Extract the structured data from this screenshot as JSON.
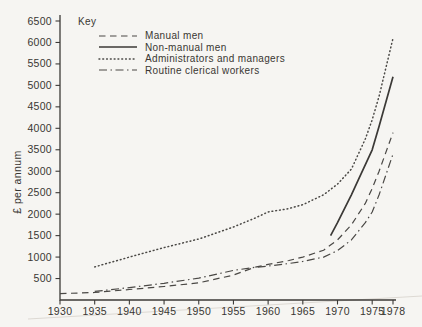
{
  "page": {
    "paper_color": "#f6f5f2",
    "ink_color": "#4a4845"
  },
  "chart_data": {
    "type": "line",
    "title": "",
    "xlabel": "",
    "ylabel": "£ per annum",
    "xlim": [
      1930,
      1978
    ],
    "ylim": [
      0,
      6500
    ],
    "x_ticks": [
      1930,
      1935,
      1940,
      1945,
      1950,
      1955,
      1960,
      1965,
      1970,
      1975,
      1978
    ],
    "y_ticks": [
      500,
      1000,
      1500,
      2000,
      2500,
      3000,
      3500,
      4000,
      4500,
      5000,
      5500,
      6000,
      6500
    ],
    "grid": false,
    "legend": {
      "title": "Key",
      "position": "top-left"
    },
    "series": [
      {
        "name": "Manual men",
        "style": "dashed",
        "points": [
          [
            1930,
            150
          ],
          [
            1935,
            175
          ],
          [
            1940,
            245
          ],
          [
            1945,
            315
          ],
          [
            1950,
            400
          ],
          [
            1955,
            580
          ],
          [
            1958,
            760
          ],
          [
            1960,
            830
          ],
          [
            1963,
            920
          ],
          [
            1965,
            1000
          ],
          [
            1968,
            1160
          ],
          [
            1970,
            1400
          ],
          [
            1972,
            1750
          ],
          [
            1974,
            2250
          ],
          [
            1975,
            2600
          ],
          [
            1976,
            3000
          ],
          [
            1978,
            3900
          ]
        ]
      },
      {
        "name": "Non-manual men",
        "style": "solid",
        "points": [
          [
            1969,
            1500
          ],
          [
            1970,
            1800
          ],
          [
            1972,
            2450
          ],
          [
            1973,
            2800
          ],
          [
            1975,
            3500
          ],
          [
            1976,
            4050
          ],
          [
            1978,
            5200
          ]
        ]
      },
      {
        "name": "Administrators and managers",
        "style": "dotted",
        "points": [
          [
            1935,
            770
          ],
          [
            1940,
            1000
          ],
          [
            1945,
            1220
          ],
          [
            1950,
            1420
          ],
          [
            1955,
            1700
          ],
          [
            1958,
            1900
          ],
          [
            1960,
            2050
          ],
          [
            1963,
            2130
          ],
          [
            1965,
            2220
          ],
          [
            1968,
            2450
          ],
          [
            1970,
            2700
          ],
          [
            1972,
            3050
          ],
          [
            1974,
            3750
          ],
          [
            1975,
            4200
          ],
          [
            1976,
            4750
          ],
          [
            1978,
            6100
          ]
        ]
      },
      {
        "name": "Routine clerical workers",
        "style": "dashdot",
        "points": [
          [
            1935,
            200
          ],
          [
            1940,
            290
          ],
          [
            1945,
            390
          ],
          [
            1950,
            510
          ],
          [
            1955,
            690
          ],
          [
            1958,
            760
          ],
          [
            1960,
            790
          ],
          [
            1963,
            850
          ],
          [
            1965,
            900
          ],
          [
            1968,
            1000
          ],
          [
            1970,
            1150
          ],
          [
            1972,
            1400
          ],
          [
            1974,
            1800
          ],
          [
            1975,
            2050
          ],
          [
            1976,
            2450
          ],
          [
            1978,
            3400
          ]
        ]
      }
    ]
  }
}
